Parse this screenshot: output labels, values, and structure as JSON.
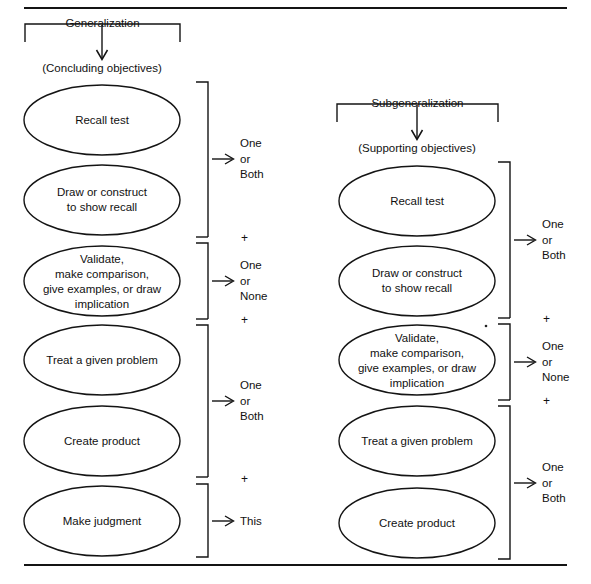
{
  "figure": {
    "type": "flow-diagram",
    "title_rule_top": true,
    "title_rule_bottom": true
  },
  "columns": [
    {
      "id": "generalization",
      "header": "Generalization",
      "subheader": "(Concluding objectives)",
      "arrow_icon": "down-arrow-icon",
      "ovals": [
        {
          "lines": [
            "Recall test"
          ]
        },
        {
          "lines": [
            "Draw or construct",
            "to show recall"
          ]
        },
        {
          "lines": [
            "Validate,",
            "make comparison,",
            "give examples, or draw",
            "implication"
          ]
        },
        {
          "lines": [
            "Treat a given problem"
          ]
        },
        {
          "lines": [
            "Create product"
          ]
        },
        {
          "lines": [
            "Make judgment"
          ]
        }
      ],
      "brackets": [
        {
          "label_lines": [
            "One",
            "or",
            "Both"
          ],
          "spans": [
            0,
            1
          ]
        },
        {
          "label_lines": [
            "One",
            "or",
            "None"
          ],
          "spans": [
            2
          ]
        },
        {
          "label_lines": [
            "One",
            "or",
            "Both"
          ],
          "spans": [
            3,
            4
          ]
        },
        {
          "label_lines": [
            "This"
          ],
          "spans": [
            5
          ]
        }
      ],
      "connectors": [
        "+",
        "+",
        "+"
      ]
    },
    {
      "id": "subgeneralization",
      "header": "Subgeneralization",
      "subheader": "(Supporting objectives)",
      "arrow_icon": "down-arrow-icon",
      "ovals": [
        {
          "lines": [
            "Recall test"
          ]
        },
        {
          "lines": [
            "Draw or construct",
            "to show recall"
          ]
        },
        {
          "lines": [
            "Validate,",
            "make comparison,",
            "give examples, or draw",
            "implication"
          ]
        },
        {
          "lines": [
            "Treat a given problem"
          ]
        },
        {
          "lines": [
            "Create product"
          ]
        }
      ],
      "brackets": [
        {
          "label_lines": [
            "One",
            "or",
            "Both"
          ],
          "spans": [
            0,
            1
          ]
        },
        {
          "label_lines": [
            "One",
            "or",
            "None"
          ],
          "spans": [
            2
          ]
        },
        {
          "label_lines": [
            "One",
            "or",
            "Both"
          ],
          "spans": [
            3,
            4
          ]
        }
      ],
      "connectors": [
        "+",
        "+"
      ]
    }
  ],
  "colors": {
    "ink": "#111111",
    "rule": "#1a1a1a",
    "background": "#ffffff"
  }
}
